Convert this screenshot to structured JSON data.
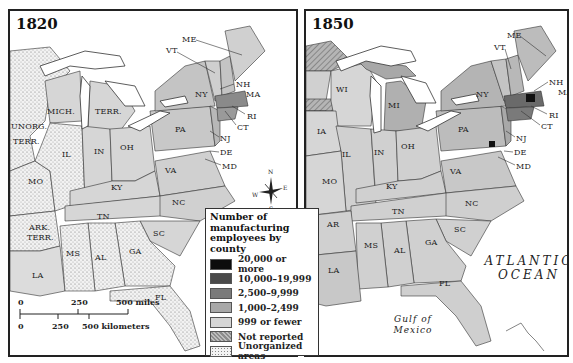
{
  "maps": [
    {
      "year": "1820",
      "states": [
        {
          "label": "ME",
          "x": 172,
          "y": 24
        },
        {
          "label": "VT",
          "x": 156,
          "y": 35
        },
        {
          "label": "NH",
          "x": 226,
          "y": 69
        },
        {
          "label": "MA",
          "x": 236,
          "y": 79
        },
        {
          "label": "NY",
          "x": 185,
          "y": 79
        },
        {
          "label": "RI",
          "x": 237,
          "y": 101
        },
        {
          "label": "CT",
          "x": 227,
          "y": 112
        },
        {
          "label": "PA",
          "x": 165,
          "y": 114
        },
        {
          "label": "NJ",
          "x": 210,
          "y": 123
        },
        {
          "label": "DE",
          "x": 210,
          "y": 137
        },
        {
          "label": "MD",
          "x": 212,
          "y": 151
        },
        {
          "label": "MICH.",
          "x": 37,
          "y": 96
        },
        {
          "label": "TERR.",
          "x": 85,
          "y": 96
        },
        {
          "label": "UNORG.",
          "x": 1,
          "y": 111
        },
        {
          "label": "TERR.",
          "x": 3,
          "y": 126
        },
        {
          "label": "IL",
          "x": 52,
          "y": 139
        },
        {
          "label": "IN",
          "x": 84,
          "y": 136
        },
        {
          "label": "OH",
          "x": 110,
          "y": 132
        },
        {
          "label": "VA",
          "x": 155,
          "y": 155
        },
        {
          "label": "MO",
          "x": 18,
          "y": 166
        },
        {
          "label": "KY",
          "x": 101,
          "y": 172
        },
        {
          "label": "NC",
          "x": 162,
          "y": 187
        },
        {
          "label": "TN",
          "x": 87,
          "y": 201
        },
        {
          "label": "ARK.",
          "x": 19,
          "y": 212
        },
        {
          "label": "TERR.",
          "x": 17,
          "y": 222
        },
        {
          "label": "SC",
          "x": 143,
          "y": 218
        },
        {
          "label": "MS",
          "x": 56,
          "y": 238
        },
        {
          "label": "GA",
          "x": 119,
          "y": 236
        },
        {
          "label": "AL",
          "x": 85,
          "y": 242
        },
        {
          "label": "LA",
          "x": 22,
          "y": 260
        },
        {
          "label": "FL",
          "x": 145,
          "y": 282
        }
      ]
    },
    {
      "year": "1850",
      "states": [
        {
          "label": "ME",
          "x": 201,
          "y": 20
        },
        {
          "label": "VT",
          "x": 188,
          "y": 32
        },
        {
          "label": "NH",
          "x": 243,
          "y": 67
        },
        {
          "label": "MA",
          "x": 252,
          "y": 77
        },
        {
          "label": "WI",
          "x": 30,
          "y": 74
        },
        {
          "label": "MI",
          "x": 82,
          "y": 90
        },
        {
          "label": "NY",
          "x": 170,
          "y": 79
        },
        {
          "label": "RI",
          "x": 243,
          "y": 100
        },
        {
          "label": "CT",
          "x": 235,
          "y": 111
        },
        {
          "label": "IA",
          "x": 11,
          "y": 116
        },
        {
          "label": "PA",
          "x": 152,
          "y": 114
        },
        {
          "label": "NJ",
          "x": 210,
          "y": 123
        },
        {
          "label": "OH",
          "x": 95,
          "y": 131
        },
        {
          "label": "IL",
          "x": 36,
          "y": 139
        },
        {
          "label": "IN",
          "x": 68,
          "y": 137
        },
        {
          "label": "DE",
          "x": 208,
          "y": 137
        },
        {
          "label": "MD",
          "x": 210,
          "y": 151
        },
        {
          "label": "VA",
          "x": 144,
          "y": 156
        },
        {
          "label": "MO",
          "x": 16,
          "y": 166
        },
        {
          "label": "KY",
          "x": 80,
          "y": 171
        },
        {
          "label": "NC",
          "x": 159,
          "y": 188
        },
        {
          "label": "TN",
          "x": 86,
          "y": 196
        },
        {
          "label": "AR",
          "x": 21,
          "y": 209
        },
        {
          "label": "SC",
          "x": 148,
          "y": 214
        },
        {
          "label": "MS",
          "x": 58,
          "y": 230
        },
        {
          "label": "GA",
          "x": 119,
          "y": 227
        },
        {
          "label": "AL",
          "x": 88,
          "y": 235
        },
        {
          "label": "LA",
          "x": 22,
          "y": 255
        },
        {
          "label": "FL",
          "x": 133,
          "y": 268
        }
      ],
      "ocean_label": [
        "ATLANTIC",
        "OCEAN"
      ],
      "gulf_label": [
        "Gulf of",
        "Mexico"
      ]
    }
  ],
  "legend": {
    "title": "Number of manufacturing employees by county",
    "items": [
      {
        "label": "20,000 or more",
        "color": "#0d0d0d"
      },
      {
        "label": "10,000–19,999",
        "color": "#4a4a4a"
      },
      {
        "label": "2,500–9,999",
        "color": "#7a7a7a"
      },
      {
        "label": "1,000–2,499",
        "color": "#a8a8a8"
      },
      {
        "label": "999 or fewer",
        "color": "#d6d6d6"
      },
      {
        "label": "Not reported",
        "color": "#9e9e9e",
        "pattern": "hatch"
      },
      {
        "label": "Unorganized areas",
        "color": "#efefef",
        "pattern": "stipple"
      }
    ]
  },
  "scale_bar": {
    "miles": [
      "0",
      "250",
      "500 miles"
    ],
    "kilometers": [
      "0",
      "250",
      "500 kilometers"
    ]
  },
  "compass": {
    "n": "N",
    "s": "S",
    "e": "E",
    "w": "W"
  }
}
